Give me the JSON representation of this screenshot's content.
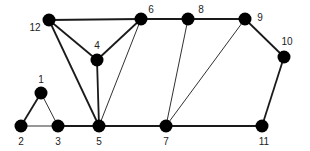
{
  "diagram": {
    "type": "undirected-graph",
    "colors": {
      "edge": "#1a1a1a",
      "node": "#000000",
      "label": "#222222",
      "background": "#ffffff"
    },
    "nodes": [
      {
        "id": "1",
        "label": "1",
        "x": 41,
        "y": 93,
        "lx": 41,
        "ly": 83
      },
      {
        "id": "2",
        "label": "2",
        "x": 21,
        "y": 126,
        "lx": 21,
        "ly": 145
      },
      {
        "id": "3",
        "label": "3",
        "x": 58,
        "y": 126,
        "lx": 58,
        "ly": 145
      },
      {
        "id": "4",
        "label": "4",
        "x": 97,
        "y": 60,
        "lx": 97,
        "ly": 49
      },
      {
        "id": "5",
        "label": "5",
        "x": 99,
        "y": 126,
        "lx": 99,
        "ly": 145
      },
      {
        "id": "6",
        "label": "6",
        "x": 141,
        "y": 19,
        "lx": 151,
        "ly": 13
      },
      {
        "id": "7",
        "label": "7",
        "x": 166,
        "y": 126,
        "lx": 166,
        "ly": 145
      },
      {
        "id": "8",
        "label": "8",
        "x": 188,
        "y": 19,
        "lx": 201,
        "ly": 13
      },
      {
        "id": "9",
        "label": "9",
        "x": 245,
        "y": 19,
        "lx": 260,
        "ly": 21
      },
      {
        "id": "10",
        "label": "10",
        "x": 284,
        "y": 57,
        "lx": 287,
        "ly": 45
      },
      {
        "id": "11",
        "label": "11",
        "x": 262,
        "y": 126,
        "lx": 264,
        "ly": 145
      },
      {
        "id": "12",
        "label": "12",
        "x": 49,
        "y": 20,
        "lx": 35,
        "ly": 31
      }
    ],
    "edges": [
      {
        "from": "12",
        "to": "6",
        "weight": "thick"
      },
      {
        "from": "6",
        "to": "8",
        "weight": "thick"
      },
      {
        "from": "8",
        "to": "9",
        "weight": "thick"
      },
      {
        "from": "9",
        "to": "10",
        "weight": "thick"
      },
      {
        "from": "10",
        "to": "11",
        "weight": "thick"
      },
      {
        "from": "11",
        "to": "7",
        "weight": "thick"
      },
      {
        "from": "7",
        "to": "5",
        "weight": "thick"
      },
      {
        "from": "5",
        "to": "3",
        "weight": "thick"
      },
      {
        "from": "3",
        "to": "2",
        "weight": "thin"
      },
      {
        "from": "2",
        "to": "1",
        "weight": "thick"
      },
      {
        "from": "1",
        "to": "3",
        "weight": "thin"
      },
      {
        "from": "12",
        "to": "4",
        "weight": "thick"
      },
      {
        "from": "4",
        "to": "6",
        "weight": "thick"
      },
      {
        "from": "12",
        "to": "5",
        "weight": "thick"
      },
      {
        "from": "4",
        "to": "5",
        "weight": "thick"
      },
      {
        "from": "6",
        "to": "5",
        "weight": "thin"
      },
      {
        "from": "8",
        "to": "7",
        "weight": "thin"
      },
      {
        "from": "9",
        "to": "7",
        "weight": "thin"
      }
    ]
  }
}
